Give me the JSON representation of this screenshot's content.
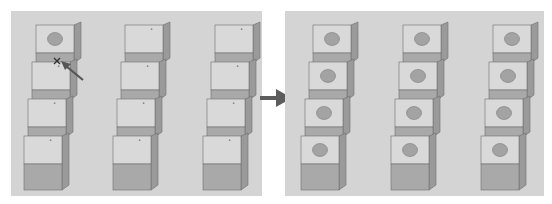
{
  "figure": {
    "colors": {
      "background": "#d4d4d4",
      "cube_top": "#d9d9d9",
      "cube_front": "#a9a9a9",
      "cube_side": "#9a9a9a",
      "hole": "#a3a3a3",
      "arrow": "#5c5c5c"
    }
  },
  "left_panel": {
    "label": "before",
    "columns": 3,
    "cubes_per_column": 4,
    "cubes_with_hole": 1,
    "cursor_icon": "move-cursor",
    "pointer": "arrow-pointer"
  },
  "transition_arrow": {
    "icon": "right-arrow"
  },
  "right_panel": {
    "label": "after",
    "columns": 3,
    "cubes_per_column": 4,
    "cubes_with_hole": 12
  }
}
